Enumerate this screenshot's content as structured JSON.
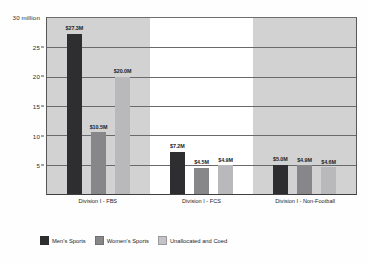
{
  "chart_data": {
    "type": "bar",
    "title": "",
    "xlabel": "",
    "ylabel": "",
    "y_axis_top_label": "30 million",
    "ylim": [
      0,
      30
    ],
    "yticks": [
      5,
      10,
      15,
      20,
      25,
      30
    ],
    "ytick_labels": [
      "5",
      "10",
      "15",
      "20",
      "25",
      "30 million"
    ],
    "grid": true,
    "legend_position": "bottom-left",
    "categories": [
      "Division I - FBS",
      "Division I - FCS",
      "Division I - Non-Football"
    ],
    "series": [
      {
        "name": "Men's Sports",
        "color": "#2e2e30",
        "values": [
          27.3,
          7.2,
          5.0
        ],
        "labels": [
          "$27.3M",
          "$7.2M",
          "$5.0M"
        ]
      },
      {
        "name": "Women's Sports",
        "color": "#87878a",
        "values": [
          10.5,
          4.5,
          4.9
        ],
        "labels": [
          "$10.5M",
          "$4.5M",
          "$4.9M"
        ]
      },
      {
        "name": "Unallocated and Coed",
        "color": "#b9b9bb",
        "values": [
          20.0,
          4.9,
          4.6
        ],
        "labels": [
          "$20.0M",
          "$4.9M",
          "$4.6M"
        ]
      }
    ]
  },
  "axis": {
    "tick_5": "5",
    "tick_10": "10",
    "tick_15": "15",
    "tick_20": "20",
    "tick_25": "25",
    "tick_30": "30 million"
  },
  "categories": {
    "cat_0": "Division I - FBS",
    "cat_1": "Division I - FCS",
    "cat_2": "Division I - Non-Football"
  },
  "legend": {
    "item_0": "Men's Sports",
    "item_1": "Women's Sports",
    "item_2": "Unallocated and Coed"
  },
  "bar_labels": {
    "g0s0": "$27.3M",
    "g0s1": "$10.5M",
    "g0s2": "$20.0M",
    "g1s0": "$7.2M",
    "g1s1": "$4.5M",
    "g1s2": "$4.9M",
    "g2s0": "$5.0M",
    "g2s1": "$4.9M",
    "g2s2": "$4.6M"
  }
}
